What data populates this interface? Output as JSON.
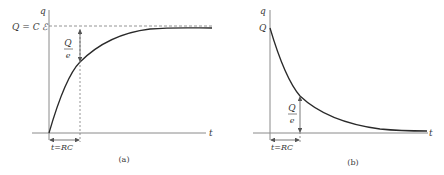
{
  "panel_a": {
    "y_axis_label": "q",
    "x_axis_label": "t",
    "asymptote_label": "Q = C ℰ",
    "fraction_num": "Q",
    "fraction_den": "e",
    "time_constant_label": "t=RC",
    "caption": "(a)"
  },
  "panel_b": {
    "y_axis_label": "q",
    "x_axis_label": "t",
    "initial_label": "Q",
    "fraction_num": "Q",
    "fraction_den": "e",
    "time_constant_label": "t=RC",
    "caption": "(b)"
  },
  "colors": {
    "axis": "#8a8a8a",
    "curve": "#2a2a2a",
    "dashed": "#7a7a7a",
    "text": "#3a3a3a"
  }
}
